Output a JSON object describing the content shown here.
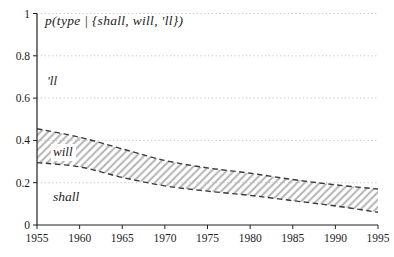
{
  "figure": {
    "title": "p(type | {shall, will, 'll})",
    "region_labels": {
      "top": "'ll",
      "band": "will",
      "bottom": "shall"
    }
  },
  "colors": {
    "axis": "#222222",
    "curve_dashed": "#3a3a3a",
    "hatch": "#b5b5b5",
    "gridline": "#bdbdbd",
    "text": "#1c1c1c",
    "background": "#ffffff"
  },
  "chart_data": {
    "type": "area",
    "title": "p(type | {shall, will, 'll})",
    "xlabel": "",
    "ylabel": "",
    "x": [
      1955,
      1960,
      1965,
      1970,
      1975,
      1980,
      1985,
      1990,
      1995
    ],
    "xlim": [
      1955,
      1995
    ],
    "ylim": [
      0,
      1
    ],
    "yticks": [
      0,
      0.2,
      0.4,
      0.6,
      0.8,
      1
    ],
    "ytick_labels": [
      "0",
      "0.2",
      "0.4",
      "0.6",
      "0.8",
      "1"
    ],
    "xtick_labels": [
      "1955",
      "1960",
      "1965",
      "1970",
      "1975",
      "1980",
      "1985",
      "1990",
      "1995"
    ],
    "grid": "horizontal-dotted",
    "legend": "none",
    "band_style": "diagonal-hatch between two dashed curves",
    "series": [
      {
        "name": "shall/will boundary (lower dashed curve, cumulative p up to shall)",
        "values": [
          0.295,
          0.275,
          0.225,
          0.185,
          0.16,
          0.14,
          0.115,
          0.09,
          0.06
        ]
      },
      {
        "name": "will/'ll boundary (upper dashed curve, cumulative p up to will)",
        "values": [
          0.455,
          0.415,
          0.36,
          0.305,
          0.27,
          0.245,
          0.215,
          0.19,
          0.17
        ]
      }
    ],
    "regions": [
      {
        "label": "'ll",
        "description": "unhatched area above upper dashed curve, up to 1"
      },
      {
        "label": "will",
        "description": "hatched band between the two dashed curves"
      },
      {
        "label": "shall",
        "description": "unhatched area below lower dashed curve, down to 0"
      }
    ]
  }
}
